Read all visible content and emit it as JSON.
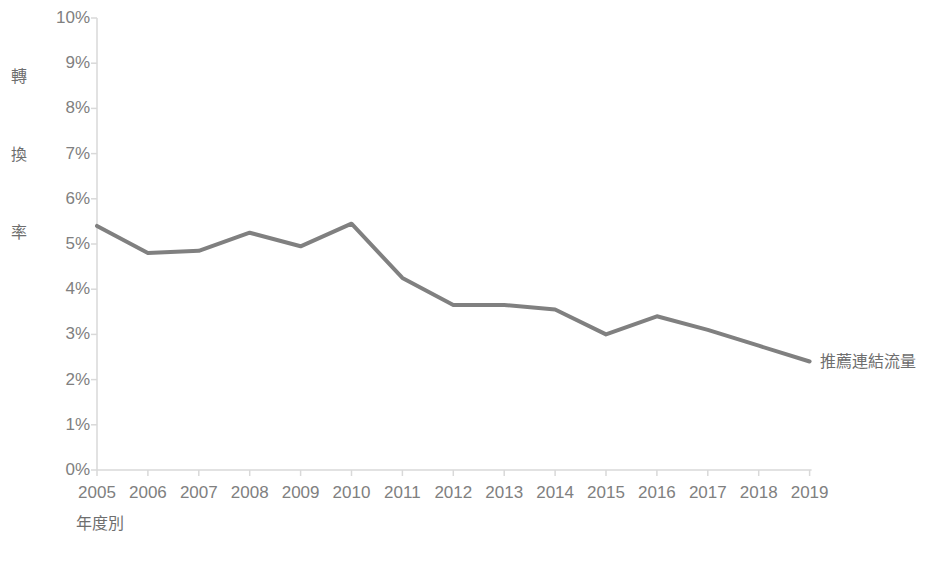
{
  "chart_data": {
    "type": "line",
    "title": "",
    "xlabel": "年度別",
    "ylabel": "轉換率",
    "categories": [
      "2005",
      "2006",
      "2007",
      "2008",
      "2009",
      "2010",
      "2011",
      "2012",
      "2013",
      "2014",
      "2015",
      "2016",
      "2017",
      "2018",
      "2019"
    ],
    "series": [
      {
        "name": "推薦連結流量",
        "values": [
          5.4,
          4.8,
          4.85,
          5.25,
          4.95,
          5.45,
          4.25,
          3.65,
          3.65,
          3.55,
          3.0,
          3.4,
          3.1,
          2.75,
          2.4
        ],
        "color": "#808080"
      }
    ],
    "ylim": [
      0,
      10
    ],
    "y_ticks": [
      "0%",
      "1%",
      "2%",
      "3%",
      "4%",
      "5%",
      "6%",
      "7%",
      "8%",
      "9%",
      "10%"
    ],
    "y_tick_values": [
      0,
      1,
      2,
      3,
      4,
      5,
      6,
      7,
      8,
      9,
      10
    ],
    "y_unit": "%",
    "grid": false,
    "legend_position": "right-of-line-end",
    "markers": false,
    "axis_color": "#d9d9d9",
    "tick_label_color": "#808080"
  },
  "axis": {
    "y_title_chars": [
      "轉",
      "換",
      "率"
    ],
    "x_title": "年度別"
  },
  "series_label": {
    "text": "推薦連結流量"
  }
}
